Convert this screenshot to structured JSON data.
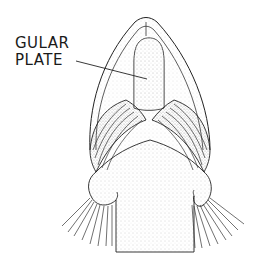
{
  "figure": {
    "labels": [
      {
        "text_line1": "GULAR",
        "text_line2": "PLATE",
        "target": "gular-plate"
      }
    ]
  },
  "colors": {
    "background": "#ffffff",
    "ink": "#1a1a1a",
    "stipple": "#555555"
  }
}
